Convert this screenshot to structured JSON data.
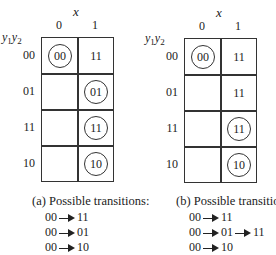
{
  "panels": [
    {
      "id": "a",
      "x_label": "x",
      "columns": [
        "0",
        "1"
      ],
      "y_label_1": "y",
      "y_sub_1": "1",
      "y_label_2": "y",
      "y_sub_2": "2",
      "rows": [
        {
          "label": "00",
          "cells": [
            {
              "value": "00",
              "circled": true
            },
            {
              "value": "11",
              "circled": false
            }
          ]
        },
        {
          "label": "01",
          "cells": [
            {
              "value": "",
              "circled": false
            },
            {
              "value": "01",
              "circled": true
            }
          ]
        },
        {
          "label": "11",
          "cells": [
            {
              "value": "",
              "circled": false
            },
            {
              "value": "11",
              "circled": true
            }
          ]
        },
        {
          "label": "10",
          "cells": [
            {
              "value": "",
              "circled": false
            },
            {
              "value": "10",
              "circled": true
            }
          ]
        }
      ],
      "caption": "(a) Possible transitions:",
      "transitions": [
        [
          "00",
          "11"
        ],
        [
          "00",
          "01"
        ],
        [
          "00",
          "10"
        ]
      ]
    },
    {
      "id": "b",
      "x_label": "x",
      "columns": [
        "0",
        "1"
      ],
      "y_label_1": "y",
      "y_sub_1": "1",
      "y_label_2": "y",
      "y_sub_2": "2",
      "rows": [
        {
          "label": "00",
          "cells": [
            {
              "value": "00",
              "circled": true
            },
            {
              "value": "11",
              "circled": false
            }
          ]
        },
        {
          "label": "01",
          "cells": [
            {
              "value": "",
              "circled": false
            },
            {
              "value": "11",
              "circled": false
            }
          ]
        },
        {
          "label": "11",
          "cells": [
            {
              "value": "",
              "circled": false
            },
            {
              "value": "11",
              "circled": true
            }
          ]
        },
        {
          "label": "10",
          "cells": [
            {
              "value": "",
              "circled": false
            },
            {
              "value": "10",
              "circled": true
            }
          ]
        }
      ],
      "caption": "(b) Possible transitions:",
      "transitions": [
        [
          "00",
          "11"
        ],
        [
          "00",
          "01",
          "11"
        ],
        [
          "00",
          "10"
        ]
      ]
    }
  ]
}
